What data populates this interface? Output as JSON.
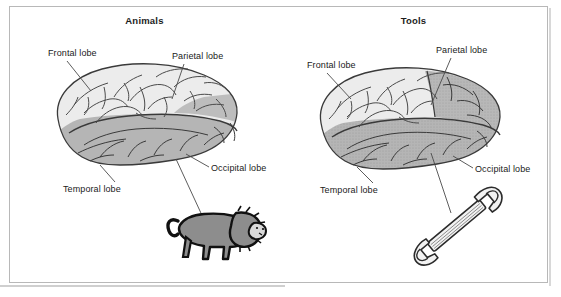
{
  "figure": {
    "background_color": "#ffffff",
    "frame_border_color": "#b8b8b8",
    "brain_upper_color": "#ececec",
    "brain_lower_color": "#b5b5b5",
    "outline_color": "#3a3a3a",
    "lion_color": "#8d8d8d",
    "wrench_color": "#f2f2f2"
  },
  "panels": [
    {
      "id": "animals",
      "title": "Animals",
      "labels": {
        "frontal": "Frontal lobe",
        "parietal": "Parietal lobe",
        "occipital": "Occipital lobe",
        "temporal": "Temporal lobe"
      },
      "object": {
        "name": "lion",
        "caption": ""
      }
    },
    {
      "id": "tools",
      "title": "Tools",
      "labels": {
        "frontal": "Frontal lobe",
        "parietal": "Parietal lobe",
        "occipital": "Occipital lobe",
        "temporal": "Temporal lobe"
      },
      "object": {
        "name": "wrench",
        "caption": ""
      }
    }
  ]
}
